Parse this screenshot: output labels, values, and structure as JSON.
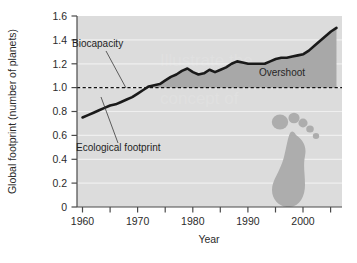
{
  "chart_data": {
    "type": "area",
    "title": "",
    "xlabel": "Year",
    "ylabel": "Global footprint (number of planets)",
    "xlim": [
      1960,
      2008
    ],
    "ylim": [
      0,
      1.6
    ],
    "grid": true,
    "legend_position": "none",
    "x_ticks": [
      1960,
      1970,
      1980,
      1990,
      2000
    ],
    "x_tick_labels": [
      "1960",
      "1970",
      "1980",
      "1990",
      "2000"
    ],
    "x_minor_ticks": [
      1965,
      1975,
      1985,
      1995,
      2005
    ],
    "y_ticks": [
      0,
      0.2,
      0.4,
      0.6,
      0.8,
      1.0,
      1.2,
      1.4,
      1.6
    ],
    "y_tick_labels": [
      "0",
      "0.2",
      "0.4",
      "0.6",
      "0.8",
      "1.0",
      "1.2",
      "1.4",
      "1.6"
    ],
    "series": [
      {
        "name": "Ecological footprint",
        "x": [
          1961,
          1962,
          1963,
          1964,
          1965,
          1966,
          1967,
          1968,
          1969,
          1970,
          1971,
          1972,
          1973,
          1974,
          1975,
          1976,
          1977,
          1978,
          1979,
          1980,
          1981,
          1982,
          1983,
          1984,
          1985,
          1986,
          1987,
          1988,
          1989,
          1990,
          1991,
          1992,
          1993,
          1994,
          1995,
          1996,
          1997,
          1998,
          1999,
          2000,
          2001,
          2002,
          2003,
          2004,
          2005,
          2006,
          2007
        ],
        "values": [
          0.75,
          0.77,
          0.79,
          0.81,
          0.83,
          0.85,
          0.86,
          0.88,
          0.9,
          0.92,
          0.95,
          0.98,
          1.01,
          1.02,
          1.03,
          1.06,
          1.09,
          1.11,
          1.14,
          1.16,
          1.13,
          1.11,
          1.12,
          1.15,
          1.13,
          1.15,
          1.17,
          1.2,
          1.22,
          1.21,
          1.2,
          1.2,
          1.2,
          1.2,
          1.22,
          1.24,
          1.25,
          1.25,
          1.26,
          1.27,
          1.28,
          1.31,
          1.35,
          1.39,
          1.43,
          1.47,
          1.5
        ]
      },
      {
        "name": "Biocapacity",
        "x": [
          1961,
          2007
        ],
        "values": [
          1.0,
          1.0
        ],
        "style": "dashed"
      }
    ],
    "annotations": [
      {
        "label": "Biocapacity",
        "target_x": 1972,
        "target_y": 1.0
      },
      {
        "label": "Ecological footprint",
        "target_x": 1970,
        "target_y": 0.92
      },
      {
        "label": "Overshoot",
        "target_x": 1997,
        "target_y": 1.12
      }
    ],
    "colors": {
      "plot_background": "#dcdcdc",
      "overshoot_fill": "#a8a8a8",
      "line": "#1a1a1a",
      "biocapacity_line": "#111111",
      "gridline": "#efefef",
      "axis": "#4a4a4a",
      "footprint_icon": "#adadad",
      "page_background": "#ffffff"
    },
    "decorations": [
      {
        "name": "footprint-icon",
        "description": "right foot silhouette with five toes"
      }
    ]
  }
}
